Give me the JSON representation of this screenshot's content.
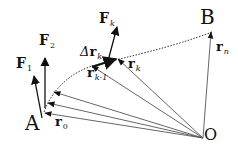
{
  "diagram": {
    "type": "vector-path-work-diagram",
    "points": {
      "A": {
        "label": "A",
        "x": 42,
        "y": 118
      },
      "B": {
        "label": "B",
        "x": 212,
        "y": 30
      },
      "O": {
        "label": "O",
        "x": 203,
        "y": 138
      }
    },
    "labels": {
      "F1": {
        "main": "F",
        "sub": "1"
      },
      "F2": {
        "main": "F",
        "sub": "2"
      },
      "Fk": {
        "main": "F",
        "sub": "k"
      },
      "drk": {
        "prefix": "Δ",
        "main": "r",
        "sub": "k"
      },
      "rk1": {
        "main": "r",
        "sub": "k-1"
      },
      "rk": {
        "main": "r",
        "sub": "k"
      },
      "r0": {
        "main": "r",
        "sub": "0"
      },
      "rn": {
        "main": "r",
        "sub": "n"
      }
    },
    "position_vectors_from_O": [
      {
        "name": "r0",
        "tip": [
          43,
          113
        ]
      },
      {
        "name": "r-mid-1",
        "tip": [
          46,
          103
        ]
      },
      {
        "name": "r-mid-2",
        "tip": [
          52,
          92
        ]
      },
      {
        "name": "r_k-1",
        "tip": [
          92,
          66
        ]
      },
      {
        "name": "r_k",
        "tip": [
          117,
          58
        ]
      },
      {
        "name": "r_n",
        "tip": [
          211,
          31
        ]
      }
    ],
    "force_vectors": [
      {
        "name": "F1",
        "from": [
          42,
          118
        ],
        "to": [
          34,
          76
        ]
      },
      {
        "name": "F2",
        "from": [
          45,
          108
        ],
        "to": [
          45,
          58
        ]
      },
      {
        "name": "Fk",
        "from": [
          108,
          61
        ],
        "to": [
          117,
          25
        ]
      }
    ],
    "displacement": {
      "name": "delta-r_k",
      "from": [
        92,
        66
      ],
      "to": [
        117,
        58
      ]
    },
    "path": {
      "style": "dotted",
      "from": "A",
      "to": "B"
    },
    "colors": {
      "ink": "#111111",
      "thin_line": "#555555",
      "background": "#ffffff"
    }
  }
}
